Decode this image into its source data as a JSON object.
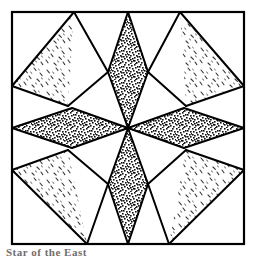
{
  "figure": {
    "background_color": "#ffffff",
    "line_color": "#000000",
    "frame": {
      "x": 12,
      "y": 12,
      "width": 232,
      "height": 232,
      "stroke_width": 2.2
    },
    "center": {
      "x": 128,
      "y": 128
    },
    "fills": {
      "dark_label": "dark stippled print",
      "dark_color": "#1a1a1a",
      "dark_density": 0.5,
      "light_label": "light sprigged print",
      "light_color": "#4a4a4a",
      "light_density": 0.05,
      "plain_label": "plain white",
      "plain_color": "#ffffff"
    },
    "pieces": [
      {
        "name": "dark-diamond-north",
        "fill": "dark",
        "points": "128,12 148,72 128,128 108,72"
      },
      {
        "name": "dark-diamond-south",
        "fill": "dark",
        "points": "128,244 148,184 128,128 108,184"
      },
      {
        "name": "dark-diamond-east",
        "fill": "dark",
        "points": "244,128 184,148 128,128 184,108"
      },
      {
        "name": "dark-diamond-west",
        "fill": "dark",
        "points": "12,128 72,148 128,128 72,108"
      },
      {
        "name": "light-triangle-northwest",
        "fill": "light",
        "points": "74,12 12,86 68,106 108,72"
      },
      {
        "name": "light-triangle-northeast",
        "fill": "light",
        "points": "180,12 244,86 186,106 148,72"
      },
      {
        "name": "light-triangle-southwest",
        "fill": "light",
        "points": "12,170 87,244 108,184 68,150"
      },
      {
        "name": "light-triangle-southeast",
        "fill": "light",
        "points": "244,170 169,244 148,184 186,150"
      },
      {
        "name": "plain-triangle-top-left-corner",
        "fill": "plain",
        "points": "12,12 74,12 12,86"
      },
      {
        "name": "plain-triangle-top-right-corner",
        "fill": "plain",
        "points": "244,12 180,12 244,86"
      },
      {
        "name": "plain-triangle-bottom-left-corner",
        "fill": "plain",
        "points": "12,244 12,170 87,244"
      },
      {
        "name": "plain-triangle-bottom-right-corner",
        "fill": "plain",
        "points": "244,244 244,170 169,244"
      },
      {
        "name": "plain-triangle-north-left",
        "fill": "plain",
        "points": "74,12 108,72 68,106"
      },
      {
        "name": "plain-triangle-north-right",
        "fill": "plain",
        "points": "180,12 148,72 186,106"
      },
      {
        "name": "plain-triangle-south-left",
        "fill": "plain",
        "points": "87,244 108,184 68,150"
      },
      {
        "name": "plain-triangle-south-right",
        "fill": "plain",
        "points": "169,244 148,184 186,150"
      },
      {
        "name": "plain-triangle-west-upper",
        "fill": "plain",
        "points": "12,86 68,106 72,108 128,128 72,108"
      },
      {
        "name": "plain-triangle-west-lower",
        "fill": "plain",
        "points": "12,170 68,150 72,148 128,128 72,148"
      }
    ],
    "seam_lines": [
      "74,12 12,86",
      "74,12 108,72",
      "12,86 68,106",
      "68,106 108,72",
      "180,12 244,86",
      "180,12 148,72",
      "244,86 186,106",
      "186,106 148,72",
      "12,170 87,244",
      "12,170 68,150",
      "87,244 108,184",
      "68,150 108,184",
      "244,170 169,244",
      "244,170 186,150",
      "169,244 148,184",
      "186,150 148,184",
      "128,12 108,72",
      "128,12 148,72",
      "108,72 128,128",
      "148,72 128,128",
      "128,244 108,184",
      "128,244 148,184",
      "108,184 128,128",
      "148,184 128,128",
      "12,128 72,108",
      "12,128 72,148",
      "72,108 128,128",
      "72,148 128,128",
      "244,128 184,108",
      "244,128 184,148",
      "184,108 128,128",
      "184,148 128,128"
    ]
  },
  "caption": {
    "text": "Star of the East"
  }
}
